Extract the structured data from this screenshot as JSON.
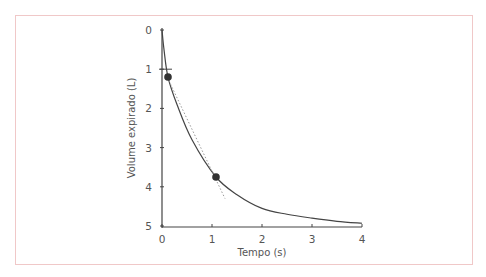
{
  "chart_data": {
    "type": "line",
    "title": "",
    "xlabel": "Tempo (s)",
    "ylabel": "Volume expirado (L)",
    "xlim": [
      0,
      4
    ],
    "ylim": [
      0,
      5
    ],
    "y_inverted": true,
    "x_ticks": [
      "0",
      "1",
      "2",
      "3",
      "4"
    ],
    "y_ticks": [
      "0",
      "1",
      "2",
      "3",
      "4",
      "5"
    ],
    "grid": false,
    "legend": null,
    "series": [
      {
        "name": "Curva volume-tempo",
        "style": "solid",
        "x": [
          0,
          0.04,
          0.12,
          0.3,
          0.6,
          1.08,
          1.5,
          2.0,
          2.5,
          3.0,
          3.5,
          4.0
        ],
        "y": [
          0,
          0.5,
          1.2,
          1.9,
          2.8,
          3.75,
          4.2,
          4.55,
          4.7,
          4.8,
          4.88,
          4.93
        ]
      },
      {
        "name": "Tangente",
        "style": "dotted",
        "x": [
          0.14,
          1.26
        ],
        "y": [
          1.3,
          4.3
        ]
      }
    ],
    "markers": [
      {
        "x": 0.12,
        "y": 1.2
      },
      {
        "x": 1.08,
        "y": 3.75
      }
    ],
    "annotations": [
      {
        "type": "tick-mark",
        "x": 0,
        "y": 1
      }
    ]
  },
  "colors": {
    "frame": "#f0c8c8",
    "axis": "#444444",
    "curve": "#444444",
    "tangent": "#999999",
    "marker": "#333333",
    "text": "#555555"
  }
}
